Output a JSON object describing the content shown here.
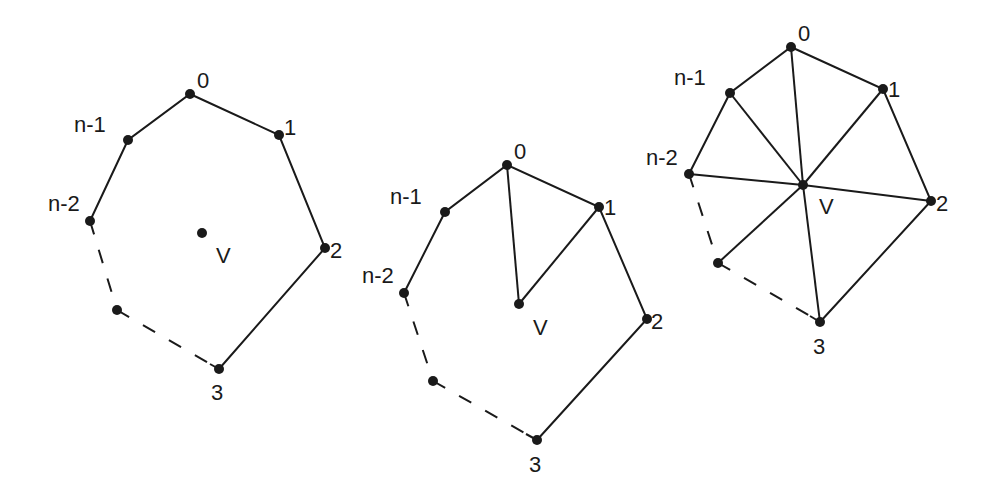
{
  "diagrams": [
    {
      "id": "polygon-with-interior-point",
      "vertices": {
        "v0": {
          "x": 190,
          "y": 94,
          "label": "0",
          "lx": 197,
          "ly": 88
        },
        "v1": {
          "x": 279,
          "y": 135,
          "label": "1",
          "lx": 285,
          "ly": 135
        },
        "v2": {
          "x": 325,
          "y": 248,
          "label": "2",
          "lx": 330,
          "ly": 258
        },
        "v3": {
          "x": 219,
          "y": 369,
          "label": "3",
          "lx": 210,
          "ly": 400
        },
        "vd": {
          "x": 117,
          "y": 310,
          "label": "",
          "lx": 0,
          "ly": 0
        },
        "vn2": {
          "x": 90,
          "y": 221,
          "label": "n-2",
          "lx": 48,
          "ly": 210
        },
        "vn1": {
          "x": 128,
          "y": 140,
          "label": "n-1",
          "lx": 74,
          "ly": 130
        },
        "V": {
          "x": 202,
          "y": 233,
          "label": "V",
          "lx": 216,
          "ly": 262
        }
      }
    },
    {
      "id": "first-triangle",
      "vertices": {
        "v0": {
          "x": 507,
          "y": 165,
          "label": "0",
          "lx": 514,
          "ly": 159
        },
        "v1": {
          "x": 599,
          "y": 207,
          "label": "1",
          "lx": 604,
          "ly": 215
        },
        "v2": {
          "x": 647,
          "y": 319,
          "label": "2",
          "lx": 651,
          "ly": 329
        },
        "v3": {
          "x": 537,
          "y": 440,
          "label": "3",
          "lx": 528,
          "ly": 472
        },
        "vd": {
          "x": 433,
          "y": 381,
          "label": "",
          "lx": 0,
          "ly": 0
        },
        "vn2": {
          "x": 404,
          "y": 293,
          "label": "n-2",
          "lx": 362,
          "ly": 280
        },
        "vn1": {
          "x": 445,
          "y": 212,
          "label": "n-1",
          "lx": 390,
          "ly": 202
        },
        "V": {
          "x": 519,
          "y": 304,
          "label": "V",
          "lx": 533,
          "ly": 335
        }
      }
    },
    {
      "id": "full-fan-triangulation",
      "vertices": {
        "v0": {
          "x": 791,
          "y": 47,
          "label": "0",
          "lx": 798,
          "ly": 42
        },
        "v1": {
          "x": 883,
          "y": 89,
          "label": "1",
          "lx": 888,
          "ly": 97
        },
        "v2": {
          "x": 931,
          "y": 201,
          "label": "2",
          "lx": 936,
          "ly": 211
        },
        "v3": {
          "x": 820,
          "y": 322,
          "label": "3",
          "lx": 814,
          "ly": 354
        },
        "vd": {
          "x": 718,
          "y": 263,
          "label": "",
          "lx": 0,
          "ly": 0
        },
        "vn2": {
          "x": 689,
          "y": 174,
          "label": "n-2",
          "lx": 646,
          "ly": 164
        },
        "vn1": {
          "x": 730,
          "y": 93,
          "label": "n-1",
          "lx": 674,
          "ly": 84
        },
        "V": {
          "x": 803,
          "y": 185,
          "label": "V",
          "lx": 819,
          "ly": 214
        }
      }
    }
  ],
  "text": {
    "d0": {
      "v0": "0",
      "v1": "1",
      "v2": "2",
      "v3": "3",
      "vn1": "n-1",
      "vn2": "n-2",
      "V": "V"
    },
    "d1": {
      "v0": "0",
      "v1": "1",
      "v2": "2",
      "v3": "3",
      "vn1": "n-1",
      "vn2": "n-2",
      "V": "V"
    },
    "d2": {
      "v0": "0",
      "v1": "1",
      "v2": "2",
      "v3": "3",
      "vn1": "n-1",
      "vn2": "n-2",
      "V": "V"
    }
  },
  "colors": {
    "stroke": "#1a1a1a",
    "background": "#ffffff"
  }
}
